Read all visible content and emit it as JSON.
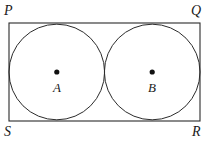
{
  "figure": {
    "kind": "geometry-diagram",
    "canvas": {
      "width": 209,
      "height": 150
    },
    "colors": {
      "background": "#ffffff",
      "stroke": "#2b2b2b",
      "label": "#1a1a1a",
      "dot": "#111111"
    },
    "rectangle": {
      "name": "PQRS",
      "x": 9,
      "y": 23,
      "width": 191,
      "height": 98,
      "stroke_width": 1.1,
      "vertices": [
        {
          "id": "P",
          "label": "P",
          "position": "top-left"
        },
        {
          "id": "Q",
          "label": "Q",
          "position": "top-right"
        },
        {
          "id": "R",
          "label": "R",
          "position": "bottom-right"
        },
        {
          "id": "S",
          "label": "S",
          "position": "bottom-left"
        }
      ]
    },
    "circles": [
      {
        "id": "A",
        "center_label": "A",
        "cx": 56.8,
        "cy": 72,
        "r": 47.8,
        "stroke_width": 1.0,
        "dot_radius": 2.6
      },
      {
        "id": "B",
        "center_label": "B",
        "cx": 152.2,
        "cy": 72,
        "r": 47.8,
        "stroke_width": 1.0,
        "dot_radius": 2.6
      }
    ],
    "tangency": {
      "between_circles_x": 104.5,
      "between_circles_y": 72
    }
  }
}
